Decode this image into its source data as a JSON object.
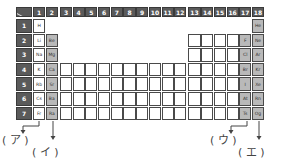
{
  "table": {
    "group_headers": [
      "1",
      "2",
      "3",
      "4",
      "5",
      "6",
      "7",
      "8",
      "9",
      "10",
      "11",
      "12",
      "13",
      "14",
      "15",
      "16",
      "17",
      "18"
    ],
    "period_headers": [
      "1",
      "2",
      "3",
      "4",
      "5",
      "6",
      "7"
    ],
    "elements": [
      {
        "symbol": "H",
        "period": 1,
        "group": 1,
        "shade": "white"
      },
      {
        "symbol": "He",
        "period": 1,
        "group": 18,
        "shade": "gray"
      },
      {
        "symbol": "Li",
        "period": 2,
        "group": 1,
        "shade": "white"
      },
      {
        "symbol": "Be",
        "period": 2,
        "group": 2,
        "shade": "gray"
      },
      {
        "symbol": "F",
        "period": 2,
        "group": 17,
        "shade": "gray"
      },
      {
        "symbol": "Ne",
        "period": 2,
        "group": 18,
        "shade": "gray"
      },
      {
        "symbol": "Na",
        "period": 3,
        "group": 1,
        "shade": "white"
      },
      {
        "symbol": "Mg",
        "period": 3,
        "group": 2,
        "shade": "gray"
      },
      {
        "symbol": "Cl",
        "period": 3,
        "group": 17,
        "shade": "gray"
      },
      {
        "symbol": "Ar",
        "period": 3,
        "group": 18,
        "shade": "gray"
      },
      {
        "symbol": "K",
        "period": 4,
        "group": 1,
        "shade": "white"
      },
      {
        "symbol": "Ca",
        "period": 4,
        "group": 2,
        "shade": "gray"
      },
      {
        "symbol": "Br",
        "period": 4,
        "group": 17,
        "shade": "gray"
      },
      {
        "symbol": "Kr",
        "period": 4,
        "group": 18,
        "shade": "gray"
      },
      {
        "symbol": "Rb",
        "period": 5,
        "group": 1,
        "shade": "white"
      },
      {
        "symbol": "Sr",
        "period": 5,
        "group": 2,
        "shade": "gray"
      },
      {
        "symbol": "I",
        "period": 5,
        "group": 17,
        "shade": "gray"
      },
      {
        "symbol": "Xe",
        "period": 5,
        "group": 18,
        "shade": "gray"
      },
      {
        "symbol": "Cs",
        "period": 6,
        "group": 1,
        "shade": "white"
      },
      {
        "symbol": "Ba",
        "period": 6,
        "group": 2,
        "shade": "gray"
      },
      {
        "symbol": "At",
        "period": 6,
        "group": 17,
        "shade": "gray"
      },
      {
        "symbol": "Rn",
        "period": 6,
        "group": 18,
        "shade": "gray"
      },
      {
        "symbol": "Fr",
        "period": 7,
        "group": 1,
        "shade": "white"
      },
      {
        "symbol": "Ra",
        "period": 7,
        "group": 2,
        "shade": "gray"
      },
      {
        "symbol": "Ts",
        "period": 7,
        "group": 17,
        "shade": "gray"
      },
      {
        "symbol": "Og",
        "period": 7,
        "group": 18,
        "shade": "gray"
      }
    ]
  },
  "answer_labels": {
    "a": "( ア )",
    "i": "( イ )",
    "u": "( ウ )",
    "e": "( エ )"
  },
  "colors": {
    "header_bg": "#5a5a5a",
    "gray_cell": "#b9b9b9",
    "grid_line": "#4a4a4a"
  }
}
